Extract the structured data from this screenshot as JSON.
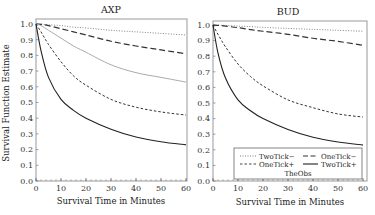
{
  "chart_data": [
    {
      "type": "line",
      "title": "AXP",
      "xlabel": "Survival Time in Minutes",
      "ylabel": "Survival Function Estimate",
      "xlim": [
        0,
        60
      ],
      "ylim": [
        0,
        1.0
      ],
      "xticks": [
        0,
        10,
        20,
        30,
        40,
        50,
        60
      ],
      "yticks": [
        0.0,
        0.1,
        0.2,
        0.3,
        0.4,
        0.5,
        0.6,
        0.7,
        0.8,
        0.9,
        1.0
      ],
      "grid": false,
      "x": [
        0,
        2,
        5,
        10,
        15,
        20,
        30,
        40,
        50,
        60
      ],
      "series": [
        {
          "name": "TwoTick−",
          "style": "dotted",
          "color": "#555555",
          "values": [
            1.0,
            0.999,
            0.995,
            0.99,
            0.98,
            0.975,
            0.96,
            0.95,
            0.94,
            0.93
          ]
        },
        {
          "name": "OneTick−",
          "style": "longdash",
          "color": "#333333",
          "values": [
            1.0,
            0.998,
            0.99,
            0.97,
            0.95,
            0.93,
            0.89,
            0.86,
            0.835,
            0.81
          ]
        },
        {
          "name": "TheObs",
          "style": "solid-gray",
          "color": "#aaaaaa",
          "values": [
            1.0,
            0.99,
            0.96,
            0.91,
            0.86,
            0.82,
            0.74,
            0.69,
            0.66,
            0.63
          ]
        },
        {
          "name": "OneTick+",
          "style": "shortdash",
          "color": "#333333",
          "values": [
            1.0,
            0.95,
            0.87,
            0.76,
            0.67,
            0.61,
            0.52,
            0.47,
            0.44,
            0.42
          ]
        },
        {
          "name": "TwoTick+",
          "style": "solid",
          "color": "#222222",
          "values": [
            1.0,
            0.83,
            0.66,
            0.52,
            0.45,
            0.4,
            0.33,
            0.28,
            0.25,
            0.23
          ]
        }
      ]
    },
    {
      "type": "line",
      "title": "BUD",
      "xlabel": "Survival Time in Minutes",
      "ylabel": "",
      "xlim": [
        0,
        60
      ],
      "ylim": [
        0,
        1.0
      ],
      "xticks": [
        0,
        10,
        20,
        30,
        40,
        50,
        60
      ],
      "yticks": [
        0.0,
        0.1,
        0.2,
        0.3,
        0.4,
        0.5,
        0.6,
        0.7,
        0.8,
        0.9,
        1.0
      ],
      "grid": false,
      "x": [
        0,
        2,
        5,
        10,
        15,
        20,
        30,
        40,
        50,
        60
      ],
      "series": [
        {
          "name": "TwoTick−",
          "style": "dotted",
          "color": "#555555",
          "values": [
            1.0,
            0.999,
            0.997,
            0.993,
            0.99,
            0.985,
            0.978,
            0.972,
            0.966,
            0.96
          ]
        },
        {
          "name": "OneTick−",
          "style": "longdash",
          "color": "#333333",
          "values": [
            1.0,
            0.998,
            0.993,
            0.983,
            0.97,
            0.96,
            0.94,
            0.915,
            0.895,
            0.87
          ]
        },
        {
          "name": "OneTick+",
          "style": "shortdash",
          "color": "#333333",
          "values": [
            1.0,
            0.94,
            0.86,
            0.75,
            0.67,
            0.61,
            0.52,
            0.47,
            0.43,
            0.41
          ]
        },
        {
          "name": "TwoTick+",
          "style": "solid",
          "color": "#222222",
          "values": [
            1.0,
            0.82,
            0.66,
            0.52,
            0.45,
            0.4,
            0.33,
            0.28,
            0.25,
            0.23
          ]
        }
      ]
    }
  ],
  "legend": {
    "position": "lower-right of BUD panel",
    "entries": [
      {
        "label": "TwoTick−",
        "style": "dotted"
      },
      {
        "label": "OneTick−",
        "style": "longdash"
      },
      {
        "label": "OneTick+",
        "style": "shortdash"
      },
      {
        "label": "TwoTick+",
        "style": "solid"
      },
      {
        "label": "TheObs",
        "style": "solid-gray"
      }
    ]
  },
  "figure": {
    "ylabel": "Survival Function Estimate"
  }
}
